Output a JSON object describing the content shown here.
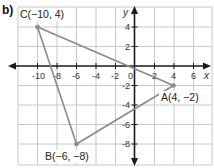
{
  "part_label": "b)",
  "axes": {
    "x_label": "x",
    "y_label": "y",
    "x_ticks": [
      "-10",
      "-8",
      "-6",
      "-4",
      "-2",
      "0",
      "2",
      "4",
      "6"
    ],
    "y_ticks": [
      "4",
      "2",
      "-2",
      "-4",
      "-6",
      "-8"
    ],
    "origin_label": "0"
  },
  "points": [
    {
      "name": "A",
      "label": "A(4, −2)",
      "x": 4,
      "y": -2
    },
    {
      "name": "B",
      "label": "B(−6, −8)",
      "x": -6,
      "y": -8
    },
    {
      "name": "C",
      "label": "C(−10, 4)",
      "x": -10,
      "y": 4
    }
  ],
  "colors": {
    "grid": "#c8c8c8",
    "axis": "#1a1a1a",
    "triangle": "#8a8a8a",
    "text": "#222222"
  }
}
